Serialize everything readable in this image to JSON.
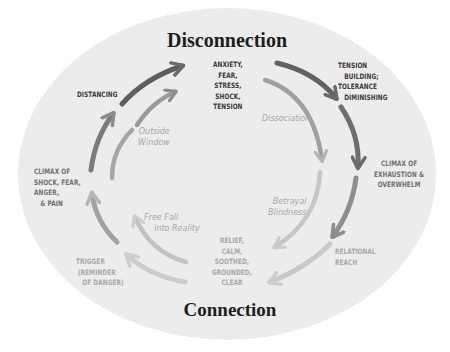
{
  "diagram": {
    "headings": {
      "top": "Disconnection",
      "bottom": "Connection"
    },
    "outer_cycle_labels": {
      "anxiety": "ANXIETY,\nFEAR,\nSTRESS,\nSHOCK,\nTENSION",
      "tension_building": "TENSION\n   BUILDING;\nTOLERANCE\n   DIMINISHING",
      "climax_exhaustion": "CLIMAX OF\nEXHAUSTION &\nOVERWHELM",
      "relational_reach": "RELATIONAL\nREACH",
      "relief": "RELIEF,\nCALM,\nSOOTHED,\nGROUNDED,\nCLEAR",
      "trigger": "TRIGGER\n (REMINDER\n   OF DANGER)",
      "climax_shock": "CLIMAX OF\nSHOCK, FEAR,\nANGER,\n   & PAIN",
      "distancing": "DISTANCING"
    },
    "inner_cycle_labels": {
      "dissociation": "Dissociation",
      "betrayal_blindness": "Betrayal\nBlindness",
      "free_fall": "Free Fall\n    into Reality",
      "outside_window": "Outside\nWindow"
    },
    "colors": {
      "background_ellipse": "#ececec",
      "arrow_dark": "#6a6a6a",
      "arrow_mid": "#8c8c8c",
      "arrow_light": "#b4b4b4",
      "arrow_faint": "#cdcdcd"
    }
  }
}
